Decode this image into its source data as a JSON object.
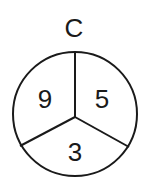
{
  "diagram": {
    "title": "C",
    "segments": {
      "left": "9",
      "right": "5",
      "bottom": "3"
    },
    "stroke_color": "#1a1a1a",
    "background_color": "#ffffff"
  }
}
